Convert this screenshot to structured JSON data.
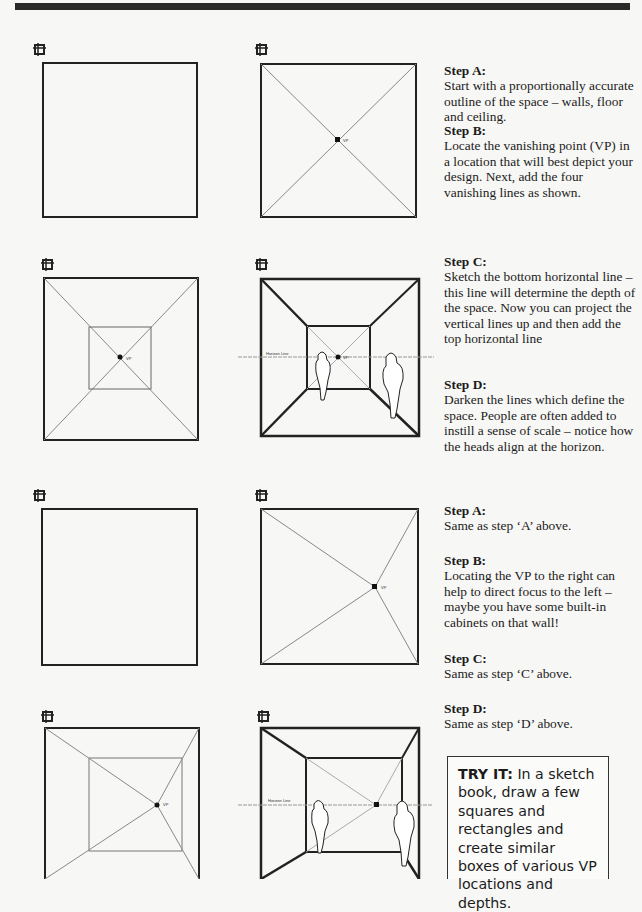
{
  "header_bar": {
    "color": "#2a2a2a"
  },
  "steps_group_1": [
    {
      "title": "Step A:",
      "body": "Start with a proportionally accurate outline of the space – walls, floor and ceiling."
    },
    {
      "title": "Step B:",
      "body": "Locate the vanishing point (VP) in a location that will best depict your design. Next, add the four vanishing lines as shown."
    },
    {
      "title": "Step C:",
      "body": "Sketch the bottom horizontal line – this line will determine the depth of the space. Now you can project the vertical lines up and then add the top horizontal line"
    },
    {
      "title": "Step D:",
      "body": "Darken the lines which define the space. People are often added to instill a sense of scale – notice how the heads align at the horizon."
    }
  ],
  "steps_group_2": [
    {
      "title": "Step A:",
      "body": "Same as step ‘A’ above."
    },
    {
      "title": "Step B:",
      "body": "Locating the VP to the right can help to direct focus to the left – maybe you have some built-in cabinets on that wall!"
    },
    {
      "title": "Step C:",
      "body": "Same as step ‘C’ above."
    },
    {
      "title": "Step D:",
      "body": "Same as step ‘D’ above."
    }
  ],
  "try_it": {
    "label": "TRY IT:",
    "body": " In a sketch book, draw a few squares and rectangles and create similar boxes of various VP locations and depths."
  },
  "diagram_labels": {
    "vp": "VP",
    "horizon": "Horizon Line"
  }
}
